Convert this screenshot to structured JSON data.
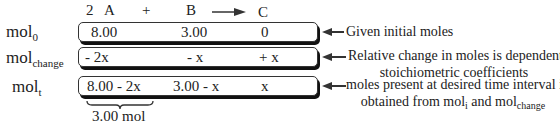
{
  "equation": {
    "coef_a": "2",
    "species_a": "A",
    "plus": "+",
    "species_b": "B",
    "species_c": "C"
  },
  "rows": [
    {
      "label_main": "mol",
      "label_sub": "0",
      "cells": [
        "8.00",
        "3.00",
        "0"
      ],
      "note_lines": [
        "Given initial moles"
      ]
    },
    {
      "label_main": "mol",
      "label_sub": "change",
      "cells": [
        "- 2x",
        "- x",
        "+ x"
      ],
      "note_lines": [
        "Relative change in moles is dependent on",
        "stoichiometric coefficients"
      ]
    },
    {
      "label_main": "mol",
      "label_sub": "t",
      "cells": [
        "8.00 - 2x",
        "3.00 - x",
        "x"
      ],
      "note_lines": [
        "moles present at desired time interval is",
        "obtained from mol",
        "i",
        " and mol",
        "change"
      ]
    }
  ],
  "brace_label": "3.00 mol"
}
